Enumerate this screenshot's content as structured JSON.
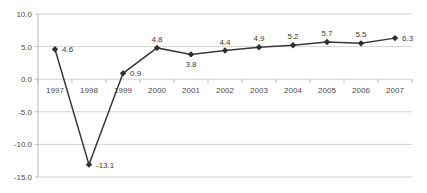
{
  "chart_data": {
    "type": "line",
    "title": "",
    "xlabel": "",
    "ylabel": "",
    "categories": [
      "1997",
      "1998",
      "1999",
      "2000",
      "2001",
      "2002",
      "2003",
      "2004",
      "2005",
      "2006",
      "2007"
    ],
    "values": [
      4.6,
      -13.1,
      0.9,
      4.8,
      3.8,
      4.4,
      4.9,
      5.2,
      5.7,
      5.5,
      6.3
    ],
    "point_labels": [
      "4.6",
      "-13.1",
      "0.9",
      "4.8",
      "3.8",
      "4.4",
      "4.9",
      "5.2",
      "5.7",
      "5.5",
      "6.3"
    ],
    "label_positions": [
      "right",
      "right",
      "right",
      "above",
      "below",
      "above",
      "above",
      "above",
      "above",
      "above",
      "right"
    ],
    "ylim": [
      -15.0,
      10.0
    ],
    "ytick_values": [
      10.0,
      5.0,
      0.0,
      -5.0,
      -10.0,
      -15.0
    ],
    "ytick_labels": [
      "10.0",
      "5.0",
      "0.0",
      "-5.0",
      "-10.0",
      "-15.0"
    ],
    "grid": true,
    "legend": "none",
    "marker": "diamond",
    "series_color": "#3a3a3a",
    "grid_color": "#c8c8c8",
    "axis_color": "#b4b4b4",
    "background": "#ffffff"
  }
}
